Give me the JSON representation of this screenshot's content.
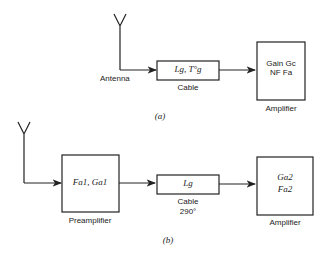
{
  "diagram_a": {
    "caption": "(a)",
    "antenna_label": "Antenna",
    "cable": {
      "label": "Cable",
      "content": "Lg, T°g"
    },
    "amplifier": {
      "label": "Amplifier",
      "line1": "Gain Gc",
      "line2": "NF Fa"
    }
  },
  "diagram_b": {
    "caption": "(b)",
    "preamplifier": {
      "label": "Preamplifier",
      "content": "Fa1, Ga1"
    },
    "cable": {
      "label": "Cable",
      "temp": "290°",
      "content": "Lg"
    },
    "amplifier": {
      "label": "Amplifier",
      "line1": "Ga2",
      "line2": "Fa2"
    }
  }
}
